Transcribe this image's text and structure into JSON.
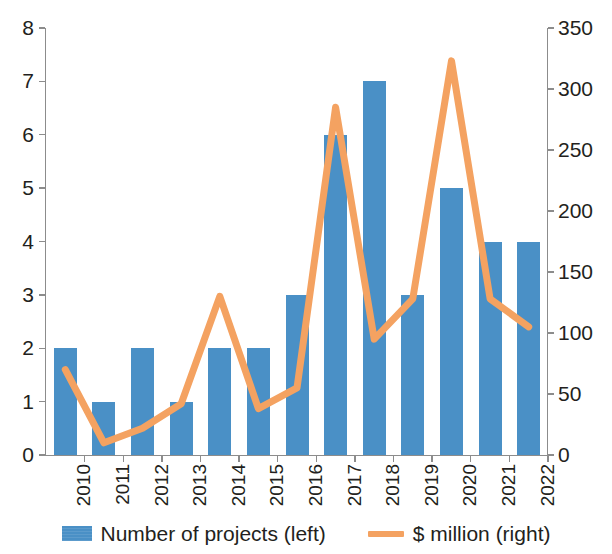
{
  "chart_data": {
    "type": "bar",
    "title": "",
    "subtitle": "",
    "xlabel": "",
    "ylabel": "",
    "grid": false,
    "legend_position": "bottom",
    "categories": [
      "2010",
      "2011",
      "2012",
      "2013",
      "2014",
      "2015",
      "2016",
      "2017",
      "2018",
      "2019",
      "2020",
      "2021",
      "2022"
    ],
    "axes": {
      "left": {
        "label": "Number of projects",
        "min": 0,
        "max": 8,
        "step": 1,
        "ticks": [
          "0",
          "1",
          "2",
          "3",
          "4",
          "5",
          "6",
          "7",
          "8"
        ]
      },
      "right": {
        "label": "$ million",
        "min": 0,
        "max": 350,
        "step": 50,
        "ticks": [
          "0",
          "50",
          "100",
          "150",
          "200",
          "250",
          "300",
          "350"
        ]
      }
    },
    "series": [
      {
        "name": "Number of projects (left)",
        "type": "bar",
        "axis": "left",
        "color": "#4a90c6",
        "values": [
          2,
          1,
          2,
          1,
          2,
          2,
          3,
          6,
          7,
          3,
          5,
          4,
          4
        ]
      },
      {
        "name": "$ million (right)",
        "type": "line",
        "axis": "right",
        "color": "#f4a261",
        "values": [
          70,
          10,
          22,
          42,
          130,
          38,
          55,
          285,
          95,
          128,
          323,
          128,
          105
        ]
      }
    ]
  },
  "legend": {
    "entries": [
      {
        "label": "Number of projects (left)",
        "marker": "bar-swatch",
        "color": "#4a90c6"
      },
      {
        "label": "$ million (right)",
        "marker": "line-swatch",
        "color": "#f4a261"
      }
    ]
  }
}
